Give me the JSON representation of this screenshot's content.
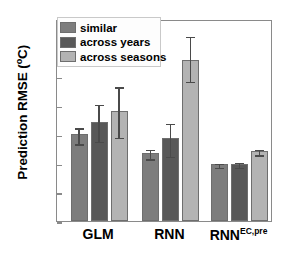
{
  "chart_data": {
    "type": "bar",
    "title": "",
    "xlabel": "",
    "ylabel": "Prediction RMSE (°C)",
    "ylabel_main": "Prediction RMSE (",
    "ylabel_deg": "o",
    "ylabel_tail": "C)",
    "ylim": [
      0,
      3.5
    ],
    "ytick_values": [
      0,
      0.5,
      1,
      1.5,
      2,
      2.5,
      3,
      3.5
    ],
    "ytick_labels": [
      "0",
      "0.5",
      "1",
      "1.5",
      "2",
      "2.5",
      "3",
      "3.5"
    ],
    "grid": false,
    "legend_position": "top-left",
    "categories": [
      "GLM",
      "RNN",
      "RNN"
    ],
    "category_labels": [
      {
        "base": "GLM",
        "sup": ""
      },
      {
        "base": "RNN",
        "sup": ""
      },
      {
        "base": "RNN",
        "sup": "EC,pre"
      }
    ],
    "series": [
      {
        "name": "similar",
        "color": "#7d7d7d",
        "values": [
          1.5,
          1.18,
          0.98
        ],
        "err_low": [
          0.15,
          0.09,
          0.03
        ],
        "err_high": [
          0.13,
          0.08,
          0.03
        ]
      },
      {
        "name": "across years",
        "color": "#585858",
        "values": [
          1.72,
          1.43,
          0.98
        ],
        "err_low": [
          0.33,
          0.3,
          0.04
        ],
        "err_high": [
          0.31,
          0.28,
          0.05
        ]
      },
      {
        "name": "across seasons",
        "color": "#b3b3b3",
        "values": [
          1.91,
          2.79,
          1.21
        ],
        "err_low": [
          0.44,
          0.35,
          0.05
        ],
        "err_high": [
          0.43,
          0.43,
          0.05
        ]
      }
    ]
  },
  "legend": {
    "items": [
      {
        "label": "similar",
        "color": "#7d7d7d"
      },
      {
        "label": "across years",
        "color": "#585858"
      },
      {
        "label": "across seasons",
        "color": "#b3b3b3"
      }
    ]
  },
  "colors": {
    "axis": "#8a8a8a",
    "bar_edge": "#6e6e6e",
    "error": "#4a4a4a",
    "background": "#ffffff",
    "text": "#000000"
  }
}
